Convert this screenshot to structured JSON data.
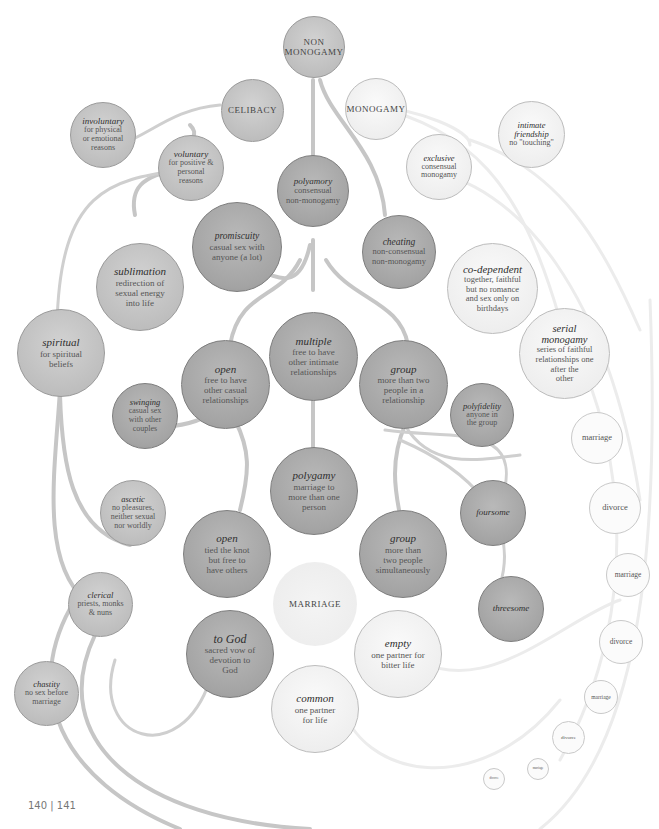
{
  "page_number": "140 | 141",
  "colors": {
    "dark_node": "#a4a4a4",
    "mid_node": "#bdbdbd",
    "light_node": "#ededed",
    "link": "#c4c4c4",
    "link_light": "#e6e6e6"
  },
  "nodes": {
    "non_monogamy": {
      "title": "",
      "caps": "NON\nMONOGAMY"
    },
    "celibacy": {
      "caps": "CELIBACY"
    },
    "monogamy": {
      "caps": "MONOGAMY"
    },
    "involuntary": {
      "title": "involuntary",
      "desc": "for physical\nor emotional\nreasons"
    },
    "voluntary": {
      "title": "voluntary",
      "desc": "for positive &\npersonal\nreasons"
    },
    "polyamory": {
      "title": "polyamory",
      "desc": "consensual\nnon-monogamy"
    },
    "exclusive": {
      "title": "exclusive",
      "desc": "consensual\nmonogamy"
    },
    "intimate_friendship": {
      "title": "intimate\nfriendship",
      "desc": "no \"touching\""
    },
    "promiscuity": {
      "title": "promiscuity",
      "desc": "casual sex with\nanyone (a lot)"
    },
    "cheating": {
      "title": "cheating",
      "desc": "non-consensual\nnon-monogamy"
    },
    "sublimation": {
      "title": "sublimation",
      "desc": "redirection of\nsexual energy\ninto life"
    },
    "co_dependent": {
      "title": "co-dependent",
      "desc": "together, faithful\nbut no romance\nand sex only on\nbirthdays"
    },
    "serial_monogamy": {
      "title": "serial\nmonogamy",
      "desc": "series of faithful\nrelationships one\nafter the\nother"
    },
    "spiritual": {
      "title": "spiritual",
      "desc": "for spiritual\nbeliefs"
    },
    "open_casual": {
      "title": "open",
      "desc": "free to have\nother casual\nrelationships"
    },
    "multiple": {
      "title": "multiple",
      "desc": "free to have\nother intimate\nrelationships"
    },
    "group_rel": {
      "title": "group",
      "desc": "more than two\npeople in a\nrelationship"
    },
    "swinging": {
      "title": "swinging",
      "desc": "casual sex\nwith other\ncouples"
    },
    "polyfidelity": {
      "title": "polyfidelity",
      "desc": "anyone in\nthe group"
    },
    "ascetic": {
      "title": "ascetic",
      "desc": "no pleasures,\nneither sexual\nnor worldly"
    },
    "polygamy": {
      "title": "polygamy",
      "desc": "marriage to\nmore than one\nperson"
    },
    "foursome": {
      "title": "foursome",
      "desc": ""
    },
    "open_married": {
      "title": "open",
      "desc": "tied the knot\nbut free to\nhave others"
    },
    "group_married": {
      "title": "group",
      "desc": "more than\ntwo people\nsimultaneously"
    },
    "clerical": {
      "title": "clerical",
      "desc": "priests, monks\n& nuns"
    },
    "marriage_hub": {
      "caps": "MARRIAGE"
    },
    "threesome": {
      "title": "threesome",
      "desc": ""
    },
    "to_god": {
      "title": "to God",
      "desc": "sacred vow of\ndevotion to\nGod"
    },
    "empty": {
      "title": "empty",
      "desc": "one partner for\nbitter life"
    },
    "chastity": {
      "title": "chastity",
      "desc": "no sex before\nmarriage"
    },
    "common": {
      "title": "common",
      "desc": "one partner\nfor life"
    }
  },
  "serial_chain": [
    "marriage",
    "divorce",
    "marriage",
    "divorce",
    "marriage",
    "divorce",
    "marriage",
    "divorce"
  ]
}
